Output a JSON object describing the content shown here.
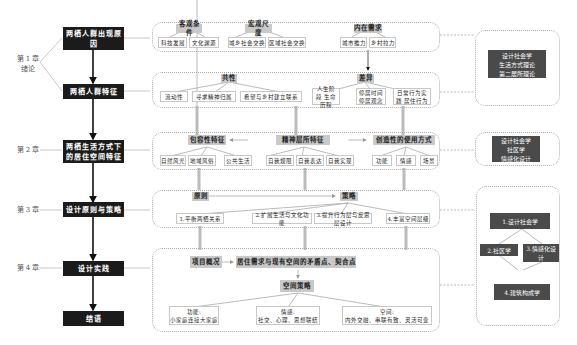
{
  "chapters": [
    {
      "label": "第 1 章",
      "sub": "绪论"
    },
    {
      "label": "第 2 章"
    },
    {
      "label": "第 3 章"
    },
    {
      "label": "第 4 章"
    }
  ],
  "main_flow": [
    "两栖人群出现原因",
    "两栖人群特征",
    "两栖生活方式下的居住空间特征",
    "设计原则与策略",
    "设计实践",
    "结语"
  ],
  "row1": {
    "groups": [
      {
        "title": "客观条件",
        "items": [
          "科技发展",
          "文化渊源"
        ]
      },
      {
        "title": "宏观尺度",
        "items": [
          "城乡社会交换",
          "区域社会交换"
        ]
      },
      {
        "title": "内在需求",
        "items": [
          "城市推力",
          "乡村拉力"
        ]
      }
    ]
  },
  "row2": {
    "groups": [
      {
        "title": "共性",
        "items": [
          "流动性",
          "寻求精神归属",
          "希望与乡村建立联系"
        ]
      },
      {
        "title": "差异",
        "items": [
          "人生阶段 生命历程",
          "停居时间 停居观念",
          "日常行为实践 居住行为"
        ]
      }
    ]
  },
  "row3": {
    "groups": [
      {
        "title": "包容性特征",
        "items": [
          "自然风光",
          "地域风俗",
          "公共生活"
        ]
      },
      {
        "title": "精神层所特征",
        "items": [
          "自我规限",
          "自我表达",
          "自我实现"
        ]
      },
      {
        "title": "创造性的使用方式",
        "items": [
          "功能",
          "情感",
          "场景"
        ]
      }
    ]
  },
  "row4": {
    "principle": "原则",
    "strategy": "策略",
    "items": [
      "1.平衡两栖关系",
      "2.扩展生活与文化功能",
      "3.提升行为层与反思层设计",
      "4.丰富空间层级"
    ]
  },
  "row5": {
    "project": "项目概况",
    "contradiction": "居住需求与现有空间的矛盾点、契合点",
    "strategy": "空间策略",
    "items": [
      {
        "title": "功能:",
        "text": "小家庭连接大家庭"
      },
      {
        "title": "情感:",
        "text": "社交、心理、思想联结"
      },
      {
        "title": "空间:",
        "text": "内外交融、串联有致、灵活可变"
      }
    ]
  },
  "theory": {
    "box1": [
      "设计社会学",
      "生活方式理论",
      "第二居所理论"
    ],
    "box2": [
      "设计社会学",
      "社区学",
      "情感化设计"
    ],
    "box3": {
      "n1": "1.设计社会学",
      "n2": "2.社区学",
      "n3": "3.情感化设计",
      "n4": "4.建筑构成学"
    }
  }
}
